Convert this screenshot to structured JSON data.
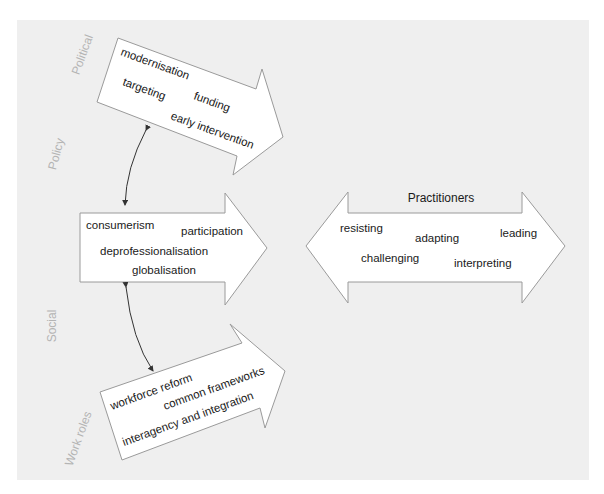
{
  "side_labels": {
    "political": "Political",
    "policy": "Policy",
    "social": "Social",
    "work_roles": "Work roles"
  },
  "political_arrow": {
    "terms": [
      "modernisation",
      "targeting",
      "funding",
      "early intervention"
    ]
  },
  "social_arrow": {
    "terms": [
      "consumerism",
      "participation",
      "deprofessionalisation",
      "globalisation"
    ]
  },
  "work_roles_arrow": {
    "terms": [
      "workforce reform",
      "common frameworks",
      "interagency and integration"
    ]
  },
  "practitioners_arrow": {
    "title": "Practitioners",
    "terms": [
      "resisting",
      "adapting",
      "leading",
      "challenging",
      "interpreting"
    ]
  },
  "colors": {
    "panel_background": "#efefef",
    "arrow_fill": "#ffffff",
    "arrow_stroke": "#9a9a9a",
    "side_label": "#b4b4b4",
    "text": "#1a1a1a"
  }
}
